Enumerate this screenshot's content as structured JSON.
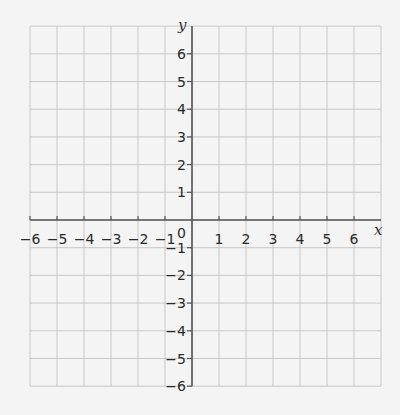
{
  "diagram": {
    "type": "coordinate-grid",
    "x_axis": {
      "label": "x",
      "min": -6,
      "max": 6,
      "ticks": [
        -6,
        -5,
        -4,
        -3,
        -2,
        -1,
        1,
        2,
        3,
        4,
        5,
        6
      ]
    },
    "y_axis": {
      "label": "y",
      "min": -6,
      "max": 6,
      "ticks": [
        6,
        5,
        4,
        3,
        2,
        1,
        -1,
        -2,
        -3,
        -4,
        -5,
        -6
      ]
    },
    "origin_label": "0",
    "grid": {
      "x_from": -6,
      "x_to": 7,
      "y_from": -6,
      "y_to": 7
    },
    "colors": {
      "background": "#f4f4f4",
      "grid": "#c8c8c8",
      "axis": "#555555",
      "text": "#2a2a2a"
    }
  }
}
